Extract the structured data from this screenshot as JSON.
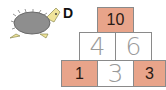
{
  "exercise": {
    "label": "D",
    "illustration": "hedgehog-icon",
    "colors": {
      "given_cell": "#e8a48a",
      "answer_cell": "#ffffff",
      "border": "#8a8a8a",
      "handwriting": "#9a9a9a"
    },
    "pyramid": {
      "top": [
        {
          "value": "10",
          "type": "given"
        }
      ],
      "middle": [
        {
          "value": "4",
          "type": "answer"
        },
        {
          "value": "6",
          "type": "answer"
        }
      ],
      "bottom": [
        {
          "value": "1",
          "type": "given"
        },
        {
          "value": "3",
          "type": "answer"
        },
        {
          "value": "3",
          "type": "given"
        }
      ]
    }
  }
}
